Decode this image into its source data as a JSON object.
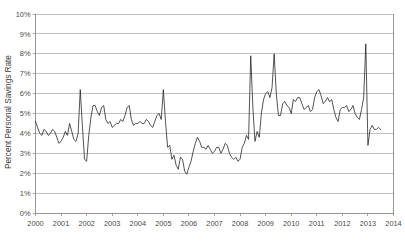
{
  "chart_data": {
    "type": "line",
    "title": "",
    "xlabel": "",
    "ylabel": "Percent Personal Savings Rate",
    "xlim": [
      2000,
      2014
    ],
    "ylim": [
      0,
      10
    ],
    "grid": true,
    "legend": false,
    "y_tick_labels": [
      "0%",
      "1%",
      "2%",
      "3%",
      "4%",
      "5%",
      "6%",
      "7%",
      "8%",
      "9%",
      "10%"
    ],
    "y_tick_values": [
      0,
      1,
      2,
      3,
      4,
      5,
      6,
      7,
      8,
      9,
      10
    ],
    "x_tick_labels": [
      "2000",
      "2001",
      "2002",
      "2003",
      "2004",
      "2005",
      "2006",
      "2007",
      "2008",
      "2009",
      "2010",
      "2011",
      "2012",
      "2013",
      "2014"
    ],
    "x_tick_values": [
      2000,
      2001,
      2002,
      2003,
      2004,
      2005,
      2006,
      2007,
      2008,
      2009,
      2010,
      2011,
      2012,
      2013,
      2014
    ],
    "line_color": "#1a1a1a",
    "grid_color": "#9a9a9a",
    "series": [
      {
        "name": "Personal Savings Rate",
        "x": [
          2000.0,
          2000.083,
          2000.167,
          2000.25,
          2000.333,
          2000.417,
          2000.5,
          2000.583,
          2000.667,
          2000.75,
          2000.833,
          2000.917,
          2001.0,
          2001.083,
          2001.167,
          2001.25,
          2001.333,
          2001.417,
          2001.5,
          2001.583,
          2001.667,
          2001.75,
          2001.833,
          2001.917,
          2002.0,
          2002.083,
          2002.167,
          2002.25,
          2002.333,
          2002.417,
          2002.5,
          2002.583,
          2002.667,
          2002.75,
          2002.833,
          2002.917,
          2003.0,
          2003.083,
          2003.167,
          2003.25,
          2003.333,
          2003.417,
          2003.5,
          2003.583,
          2003.667,
          2003.75,
          2003.833,
          2003.917,
          2004.0,
          2004.083,
          2004.167,
          2004.25,
          2004.333,
          2004.417,
          2004.5,
          2004.583,
          2004.667,
          2004.75,
          2004.833,
          2004.917,
          2005.0,
          2005.083,
          2005.167,
          2005.25,
          2005.333,
          2005.417,
          2005.5,
          2005.583,
          2005.667,
          2005.75,
          2005.833,
          2005.917,
          2006.0,
          2006.083,
          2006.167,
          2006.25,
          2006.333,
          2006.417,
          2006.5,
          2006.583,
          2006.667,
          2006.75,
          2006.833,
          2006.917,
          2007.0,
          2007.083,
          2007.167,
          2007.25,
          2007.333,
          2007.417,
          2007.5,
          2007.583,
          2007.667,
          2007.75,
          2007.833,
          2007.917,
          2008.0,
          2008.083,
          2008.167,
          2008.25,
          2008.333,
          2008.417,
          2008.5,
          2008.583,
          2008.667,
          2008.75,
          2008.833,
          2008.917,
          2009.0,
          2009.083,
          2009.167,
          2009.25,
          2009.333,
          2009.417,
          2009.5,
          2009.583,
          2009.667,
          2009.75,
          2009.833,
          2009.917,
          2010.0,
          2010.083,
          2010.167,
          2010.25,
          2010.333,
          2010.417,
          2010.5,
          2010.583,
          2010.667,
          2010.75,
          2010.833,
          2010.917,
          2011.0,
          2011.083,
          2011.167,
          2011.25,
          2011.333,
          2011.417,
          2011.5,
          2011.583,
          2011.667,
          2011.75,
          2011.833,
          2011.917,
          2012.0,
          2012.083,
          2012.167,
          2012.25,
          2012.333,
          2012.417,
          2012.5,
          2012.583,
          2012.667,
          2012.75,
          2012.833,
          2012.917,
          2013.0,
          2013.083,
          2013.167,
          2013.25,
          2013.333,
          2013.417,
          2013.5
        ],
        "values": [
          4.6,
          4.3,
          4.0,
          3.9,
          4.2,
          4.1,
          3.9,
          4.0,
          4.2,
          4.1,
          3.8,
          3.5,
          3.6,
          3.8,
          4.1,
          3.9,
          4.5,
          4.1,
          3.7,
          3.6,
          4.0,
          6.2,
          4.4,
          2.7,
          2.6,
          3.9,
          4.8,
          5.4,
          5.4,
          5.1,
          4.9,
          5.3,
          5.4,
          4.7,
          4.5,
          4.6,
          4.3,
          4.4,
          4.5,
          4.5,
          4.7,
          4.6,
          4.9,
          5.3,
          5.4,
          4.7,
          4.4,
          4.5,
          4.5,
          4.6,
          4.5,
          4.5,
          4.7,
          4.6,
          4.4,
          4.3,
          4.6,
          4.9,
          5.0,
          4.7,
          6.2,
          4.6,
          3.3,
          3.4,
          2.7,
          2.9,
          2.4,
          2.2,
          2.8,
          2.7,
          2.1,
          1.95,
          2.3,
          2.6,
          3.1,
          3.5,
          3.8,
          3.6,
          3.3,
          3.3,
          3.2,
          3.4,
          3.2,
          3.0,
          3.1,
          3.3,
          3.3,
          3.0,
          3.2,
          3.5,
          3.4,
          3.0,
          2.8,
          2.7,
          2.8,
          2.6,
          2.7,
          3.3,
          3.5,
          3.9,
          3.7,
          7.9,
          5.3,
          3.6,
          4.1,
          3.8,
          5.0,
          5.7,
          6.0,
          6.1,
          5.8,
          6.3,
          8.0,
          6.0,
          4.9,
          4.9,
          5.5,
          5.6,
          5.4,
          5.3,
          5.0,
          5.7,
          5.6,
          5.8,
          5.8,
          5.5,
          5.2,
          5.3,
          5.4,
          5.1,
          5.2,
          5.8,
          6.1,
          6.2,
          5.9,
          5.5,
          5.6,
          5.8,
          5.6,
          5.7,
          5.2,
          4.8,
          4.6,
          5.2,
          5.3,
          5.3,
          5.4,
          5.1,
          5.2,
          5.4,
          5.0,
          4.8,
          4.7,
          5.2,
          5.8,
          8.5,
          3.4,
          4.2,
          4.4,
          4.2,
          4.2,
          4.3,
          4.2
        ]
      }
    ]
  },
  "axes": {
    "y_axis_title": "Percent Personal Savings Rate"
  }
}
